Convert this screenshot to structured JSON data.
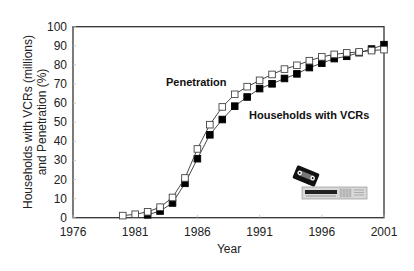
{
  "chart_data": {
    "type": "line",
    "title": "",
    "xlabel": "Year",
    "ylabel": "Households with VCRs (millions) and Penetration (%)",
    "ylabel_lines": [
      "Households with VCRs (millions)",
      "and Penetration (%)"
    ],
    "xlim": [
      1976,
      2001
    ],
    "ylim": [
      0,
      100
    ],
    "x_ticks": [
      1976,
      1981,
      1986,
      1991,
      1996,
      2001
    ],
    "y_ticks": [
      0,
      10,
      20,
      30,
      40,
      50,
      60,
      70,
      80,
      90,
      100
    ],
    "grid": false,
    "legend": "inline labels",
    "series": [
      {
        "name": "Penetration",
        "marker": "open-square",
        "x": [
          1980,
          1981,
          1982,
          1983,
          1984,
          1985,
          1986,
          1987,
          1988,
          1989,
          1990,
          1991,
          1992,
          1993,
          1994,
          1995,
          1996,
          1997,
          1998,
          1999,
          2000,
          2001
        ],
        "values": [
          1.1,
          1.8,
          3.1,
          5.5,
          10.6,
          20.8,
          36.0,
          48.7,
          58.0,
          64.6,
          68.6,
          71.9,
          75.0,
          77.8,
          79.8,
          82.2,
          84.2,
          85.5,
          86.3,
          86.8,
          87.5,
          88.0
        ]
      },
      {
        "name": "Households with VCRs",
        "marker": "filled-square",
        "x": [
          1982,
          1983,
          1984,
          1985,
          1986,
          1987,
          1988,
          1989,
          1990,
          1991,
          1992,
          1993,
          1994,
          1995,
          1996,
          1997,
          1998,
          1999,
          2000,
          2001
        ],
        "values": [
          1.5,
          3.5,
          7.7,
          18.0,
          30.9,
          43.4,
          51.4,
          58.4,
          63.2,
          67.6,
          70.1,
          72.9,
          75.3,
          78.6,
          80.9,
          83.3,
          84.5,
          86.4,
          88.3,
          90.6
        ]
      }
    ],
    "annotations": [
      {
        "text": "Penetration",
        "x": 1983.5,
        "y": 70
      },
      {
        "text": "Households with VCRs",
        "x": 1991.5,
        "y": 52
      }
    ]
  },
  "labels": {
    "penetration": "Penetration",
    "households": "Households with VCRs",
    "xlabel": "Year",
    "ylabel_line1": "Households with VCRs (millions)",
    "ylabel_line2": "and Penetration (%)"
  },
  "illustration": {
    "name": "VCR and videocassette clipart"
  }
}
